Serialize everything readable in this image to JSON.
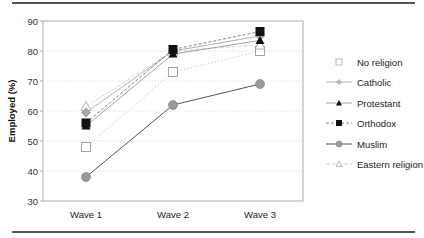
{
  "chart_data": {
    "type": "line",
    "title": "",
    "xlabel": "",
    "ylabel": "Employed (%)",
    "ylim": [
      30,
      90
    ],
    "yticks": [
      30,
      40,
      50,
      60,
      70,
      80,
      90
    ],
    "grid": true,
    "legend_position": "right",
    "categories": [
      "Wave 1",
      "Wave 2",
      "Wave 3"
    ],
    "series": [
      {
        "name": "No religion",
        "values": [
          48,
          73,
          80
        ],
        "marker": "square-open",
        "line": "dotted-light",
        "color": "#bbbbbb"
      },
      {
        "name": "Catholic",
        "values": [
          59.5,
          80,
          85
        ],
        "marker": "diamond-gray",
        "line": "solid-light",
        "color": "#999999"
      },
      {
        "name": "Protestant",
        "values": [
          55,
          79,
          83.5
        ],
        "marker": "triangle-filled",
        "line": "solid-thin",
        "color": "#888888"
      },
      {
        "name": "Orthodox",
        "values": [
          56,
          80.5,
          86.5
        ],
        "marker": "square-filled",
        "line": "dashed",
        "color": "#666666"
      },
      {
        "name": "Muslim",
        "values": [
          38,
          62,
          69
        ],
        "marker": "circle-gray",
        "line": "solid",
        "color": "#555555"
      },
      {
        "name": "Eastern religion",
        "values": [
          61.5,
          80,
          82
        ],
        "marker": "triangle-open",
        "line": "dashed-light",
        "color": "#cccccc"
      }
    ]
  }
}
